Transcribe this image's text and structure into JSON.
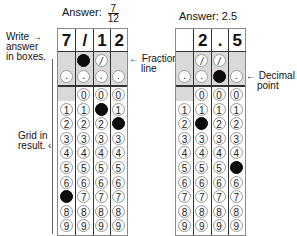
{
  "left": {
    "answer_prefix": "Answer:",
    "answer_num": "7",
    "answer_den": "12",
    "boxes": [
      "7",
      "/",
      "1",
      "2"
    ],
    "slash_row": [
      "",
      "filled",
      "slash",
      ""
    ],
    "decimal_row": [
      "dot",
      "dot",
      "dot",
      "dot"
    ],
    "digit_fills": [
      7,
      null,
      1,
      2
    ],
    "zero_start_col": 1,
    "notes": {
      "write_line1": "Write",
      "write_line2": "answer",
      "write_line3": "in boxes.",
      "fraction_line1": "Fraction",
      "fraction_line2": "line",
      "grid_line1": "Grid in",
      "grid_line2": "result."
    }
  },
  "right": {
    "answer_label": "Answer: 2.5",
    "boxes": [
      "",
      "2",
      ".",
      "5"
    ],
    "slash_row": [
      "",
      "slash",
      "slash",
      ""
    ],
    "decimal_row": [
      "dot",
      "dot",
      "filled",
      "dot"
    ],
    "digit_fills": [
      null,
      2,
      null,
      5
    ],
    "zero_start_col": 1,
    "notes": {
      "decimal_line1": "Decimal",
      "decimal_line2": "point"
    }
  },
  "arrow_glyph": "←",
  "slash_glyph": "/",
  "digits": [
    "0",
    "1",
    "2",
    "3",
    "4",
    "5",
    "6",
    "7",
    "8",
    "9"
  ]
}
